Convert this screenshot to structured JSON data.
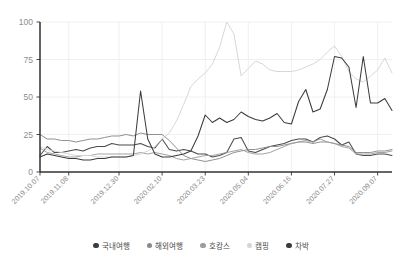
{
  "chart_data": {
    "type": "line",
    "title": "",
    "subtitle": "",
    "xlabel": "",
    "ylabel": "",
    "ylim": [
      0,
      100
    ],
    "yticks": [
      0,
      25,
      50,
      75,
      100
    ],
    "grid": true,
    "legend_position": "bottom",
    "xtick_labels": [
      "2019.10.07",
      "2019.11.08",
      "2019.12.30",
      "2020.02.10",
      "2020.03.23",
      "2020.05.04",
      "2020.06.16",
      "2020.07.27",
      "2020.09.07"
    ],
    "xtick_indices": [
      0,
      4,
      11,
      17,
      23,
      29,
      35,
      41,
      47
    ],
    "n_points": 50,
    "series": [
      {
        "name": "국내여행",
        "color": "#4a4a4a",
        "values": [
          11,
          17,
          13,
          13,
          14,
          15,
          14,
          16,
          17,
          17,
          19,
          18,
          18,
          18,
          19,
          17,
          16,
          22,
          15,
          14,
          15,
          14,
          12,
          12,
          10,
          11,
          13,
          22,
          23,
          14,
          13,
          15,
          17,
          18,
          19,
          21,
          22,
          22,
          20,
          23,
          24,
          22,
          18,
          20,
          12,
          11,
          11,
          12,
          12,
          11
        ]
      },
      {
        "name": "해외여행",
        "color": "#8a8a8a",
        "values": [
          25,
          22,
          22,
          21,
          21,
          20,
          21,
          22,
          22,
          23,
          24,
          24,
          25,
          24,
          26,
          25,
          25,
          25,
          21,
          16,
          11,
          9,
          8,
          7,
          8,
          9,
          11,
          13,
          14,
          15,
          15,
          16,
          17,
          17,
          18,
          19,
          20,
          20,
          19,
          20,
          20,
          19,
          18,
          17,
          13,
          13,
          13,
          14,
          14,
          15
        ]
      },
      {
        "name": "호캉스",
        "color": "#9d9d9d",
        "values": [
          16,
          13,
          12,
          11,
          10,
          10,
          11,
          11,
          12,
          12,
          12,
          12,
          12,
          12,
          13,
          12,
          13,
          12,
          11,
          9,
          8,
          9,
          10,
          11,
          11,
          12,
          13,
          14,
          15,
          13,
          12,
          12,
          13,
          15,
          17,
          19,
          20,
          21,
          20,
          22,
          20,
          19,
          17,
          16,
          12,
          12,
          12,
          13,
          13,
          14
        ]
      },
      {
        "name": "캠핑",
        "color": "#d5d5d5",
        "values": [
          17,
          15,
          14,
          13,
          12,
          11,
          11,
          11,
          10,
          10,
          10,
          10,
          10,
          11,
          12,
          14,
          17,
          22,
          26,
          34,
          45,
          57,
          62,
          66,
          72,
          83,
          100,
          92,
          64,
          69,
          74,
          72,
          68,
          67,
          67,
          67,
          68,
          70,
          72,
          75,
          80,
          84,
          77,
          67,
          62,
          60,
          64,
          68,
          76,
          66
        ]
      },
      {
        "name": "차박",
        "color": "#3c3c3c",
        "values": [
          10,
          12,
          11,
          10,
          9,
          9,
          8,
          8,
          9,
          9,
          10,
          10,
          10,
          11,
          54,
          22,
          12,
          10,
          10,
          11,
          12,
          14,
          24,
          38,
          33,
          36,
          33,
          35,
          40,
          37,
          35,
          34,
          36,
          39,
          33,
          32,
          47,
          55,
          40,
          42,
          55,
          77,
          76,
          70,
          43,
          77,
          46,
          46,
          49,
          41
        ]
      }
    ]
  },
  "legend": {
    "items": [
      {
        "label": "국내여행",
        "color": "#3c3c3c",
        "name": "domestic-travel"
      },
      {
        "label": "해외여행",
        "color": "#8a8a8a",
        "name": "overseas-travel"
      },
      {
        "label": "호캉스",
        "color": "#9d9d9d",
        "name": "hotel-vacation"
      },
      {
        "label": "캠핑",
        "color": "#d5d5d5",
        "name": "camping"
      },
      {
        "label": "차박",
        "color": "#3c3c3c",
        "name": "car-camping"
      }
    ]
  },
  "axis": {
    "y_labels": [
      "100",
      "75",
      "50",
      "25",
      "0"
    ],
    "axis_color": "#333333",
    "grid_color": "#ececec",
    "tick_text_color": "#8d8d8d"
  }
}
